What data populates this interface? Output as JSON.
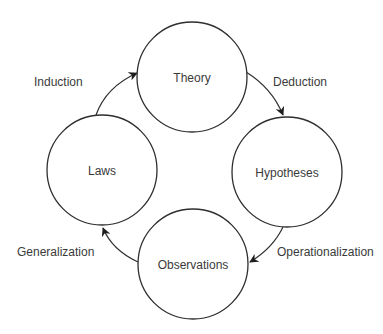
{
  "diagram": {
    "title": "",
    "type": "cycle",
    "nodes": [
      {
        "id": "theory",
        "label": "Theory",
        "cx": 192,
        "cy": 77,
        "r": 55
      },
      {
        "id": "hypotheses",
        "label": "Hypotheses",
        "cx": 287,
        "cy": 172,
        "r": 55
      },
      {
        "id": "observations",
        "label": "Observations",
        "cx": 193,
        "cy": 264,
        "r": 55
      },
      {
        "id": "laws",
        "label": "Laws",
        "cx": 102,
        "cy": 170,
        "r": 55
      }
    ],
    "edges": [
      {
        "from": "theory",
        "to": "hypotheses",
        "label": "Deduction"
      },
      {
        "from": "hypotheses",
        "to": "observations",
        "label": "Operationalization"
      },
      {
        "from": "observations",
        "to": "laws",
        "label": "Generalization"
      },
      {
        "from": "laws",
        "to": "theory",
        "label": "Induction"
      }
    ],
    "colors": {
      "stroke": "#2e2e2e",
      "text": "#3a3a3a",
      "background": "#ffffff"
    }
  }
}
